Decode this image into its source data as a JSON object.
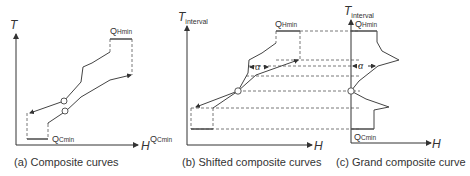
{
  "panels": [
    {
      "id": "a",
      "caption": "(a) Composite curves",
      "y_axis_label": "T",
      "x_axis_label": "H",
      "labels": {
        "q_hot": "Q",
        "q_hot_sub": "Hmin",
        "q_cold": "Q",
        "q_cold_sub": "Cmin"
      }
    },
    {
      "id": "b",
      "caption": "(b) Shifted composite curves",
      "y_axis_label": "T",
      "y_axis_sub": "interval",
      "x_axis_label": "H",
      "labels": {
        "q_hot": "Q",
        "q_hot_sub": "Hmin",
        "q_cold": "Q",
        "q_cold_sub": "Cmin",
        "alpha": "α"
      }
    },
    {
      "id": "c",
      "caption": "(c) Grand composite curve",
      "y_axis_label": "T",
      "y_axis_sub": "interval",
      "x_axis_label": "H",
      "labels": {
        "q_hot": "Q",
        "q_hot_sub": "Hmin",
        "q_cold": "Q",
        "q_cold_sub": "Cmin",
        "alpha": "α"
      }
    }
  ],
  "colors": {
    "line": "#444444",
    "background": "#ffffff"
  }
}
